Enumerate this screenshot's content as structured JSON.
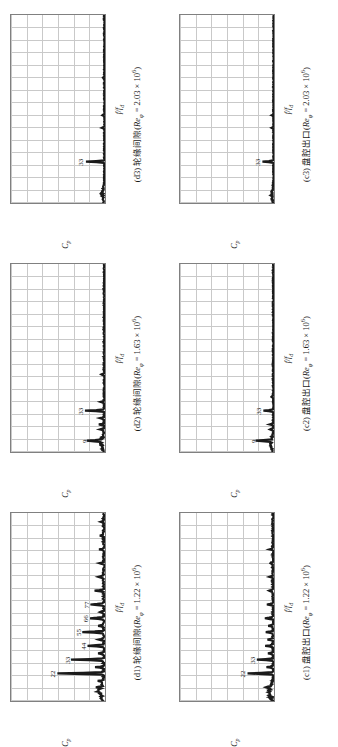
{
  "figure": {
    "orientation": "rotated-90-ccw",
    "columns": 3,
    "rows": 2,
    "axis": {
      "ylabel_main": "C",
      "ylabel_sub": "p",
      "xlabel_main": "f/f",
      "xlabel_sub": "d",
      "yticks": [
        "0",
        "0.1",
        "0.2",
        "0.3",
        "0.4",
        "0.5",
        "0.6"
      ],
      "xticks": [
        "0",
        "10",
        "20",
        "30",
        "40",
        "50",
        "60",
        "70",
        "80",
        "90",
        "100",
        "110",
        "120",
        "130",
        "140",
        "150"
      ]
    }
  },
  "chart_data": [
    {
      "id": "d1",
      "type": "line",
      "title": "(d1) 轮缘间隙(Re_φ = 1.22 × 10⁶)",
      "caption_prefix": "(d1) 轮缘间隙(",
      "caption_sym": "Re",
      "caption_sub": "φ",
      "caption_value": " = 1.22 × 10",
      "caption_sup": "6",
      "caption_suffix": ")",
      "xlabel": "f/f_d",
      "ylabel": "C_p",
      "xlim": [
        0,
        150
      ],
      "ylim": [
        0,
        0.6
      ],
      "grid": true,
      "peaks": [
        {
          "x": 22,
          "y": 0.3,
          "label": "22"
        },
        {
          "x": 33,
          "y": 0.205,
          "label": "33"
        },
        {
          "x": 44,
          "y": 0.105,
          "label": "44"
        },
        {
          "x": 55,
          "y": 0.135,
          "label": "55"
        },
        {
          "x": 66,
          "y": 0.09,
          "label": "66"
        },
        {
          "x": 77,
          "y": 0.082,
          "label": "77"
        }
      ],
      "minor_peaks": [
        {
          "x": 11,
          "y": 0.04
        },
        {
          "x": 16,
          "y": 0.03
        },
        {
          "x": 27,
          "y": 0.05
        },
        {
          "x": 38,
          "y": 0.035
        },
        {
          "x": 49,
          "y": 0.035
        },
        {
          "x": 60,
          "y": 0.03
        },
        {
          "x": 71,
          "y": 0.025
        },
        {
          "x": 88,
          "y": 0.055
        },
        {
          "x": 99,
          "y": 0.04
        },
        {
          "x": 110,
          "y": 0.03
        },
        {
          "x": 121,
          "y": 0.025
        },
        {
          "x": 132,
          "y": 0.022
        },
        {
          "x": 143,
          "y": 0.018
        }
      ],
      "noise_floor": 0.012
    },
    {
      "id": "d2",
      "type": "line",
      "title": "(d2) 轮缘间隙(Re_φ = 1.63 × 10⁶)",
      "caption_prefix": "(d2) 轮缘间隙(",
      "caption_sym": "Re",
      "caption_sub": "φ",
      "caption_value": " = 1.63 × 10",
      "caption_sup": "6",
      "caption_suffix": ")",
      "xlabel": "f/f_d",
      "ylabel": "C_p",
      "xlim": [
        0,
        150
      ],
      "ylim": [
        0,
        0.6
      ],
      "grid": true,
      "peaks": [
        {
          "x": 9,
          "y": 0.098,
          "label": "9"
        },
        {
          "x": 33,
          "y": 0.12,
          "label": "33"
        }
      ],
      "minor_peaks": [
        {
          "x": 18,
          "y": 0.03
        },
        {
          "x": 22,
          "y": 0.035
        },
        {
          "x": 27,
          "y": 0.028
        },
        {
          "x": 40,
          "y": 0.022
        },
        {
          "x": 62,
          "y": 0.016
        }
      ],
      "noise_floor": 0.008
    },
    {
      "id": "d3",
      "type": "line",
      "title": "(d3) 轮缘间隙(Re_φ = 2.03 × 10⁶)",
      "caption_prefix": "(d3) 轮缘间隙(",
      "caption_sym": "Re",
      "caption_sub": "φ",
      "caption_value": " = 2.03 × 10",
      "caption_sup": "6",
      "caption_suffix": ")",
      "xlabel": "f/f_d",
      "ylabel": "C_p",
      "xlim": [
        0,
        150
      ],
      "ylim": [
        0,
        0.6
      ],
      "grid": true,
      "peaks": [
        {
          "x": 33,
          "y": 0.12,
          "label": "33"
        }
      ],
      "minor_peaks": [
        {
          "x": 60,
          "y": 0.014
        },
        {
          "x": 70,
          "y": 0.012
        },
        {
          "x": 100,
          "y": 0.01
        }
      ],
      "noise_floor": 0.006
    },
    {
      "id": "c1",
      "type": "line",
      "title": "(c1) 盘腔出口(Re_φ = 1.22 × 10⁶)",
      "caption_prefix": "(c1) 盘腔出口(",
      "caption_sym": "Re",
      "caption_sub": "φ",
      "caption_value": " = 1.22 × 10",
      "caption_sup": "6",
      "caption_suffix": ")",
      "xlabel": "f/f_d",
      "ylabel": "C_p",
      "xlim": [
        0,
        150
      ],
      "ylim": [
        0,
        0.6
      ],
      "grid": true,
      "peaks": [
        {
          "x": 22,
          "y": 0.165,
          "label": "22"
        },
        {
          "x": 33,
          "y": 0.105,
          "label": "33"
        }
      ],
      "minor_peaks": [
        {
          "x": 11,
          "y": 0.035
        },
        {
          "x": 27,
          "y": 0.038
        },
        {
          "x": 38,
          "y": 0.03
        },
        {
          "x": 44,
          "y": 0.05
        },
        {
          "x": 49,
          "y": 0.032
        },
        {
          "x": 55,
          "y": 0.045
        },
        {
          "x": 60,
          "y": 0.03
        },
        {
          "x": 66,
          "y": 0.055
        },
        {
          "x": 77,
          "y": 0.035
        },
        {
          "x": 88,
          "y": 0.028
        },
        {
          "x": 99,
          "y": 0.024
        },
        {
          "x": 110,
          "y": 0.02
        },
        {
          "x": 121,
          "y": 0.018
        }
      ],
      "noise_floor": 0.01
    },
    {
      "id": "c2",
      "type": "line",
      "title": "(c2) 盘腔出口(Re_φ = 1.63 × 10⁶)",
      "caption_prefix": "(c2) 盘腔出口(",
      "caption_sym": "Re",
      "caption_sub": "φ",
      "caption_value": " = 1.63 × 10",
      "caption_sup": "6",
      "caption_suffix": ")",
      "xlabel": "f/f_d",
      "ylabel": "C_p",
      "xlim": [
        0,
        150
      ],
      "ylim": [
        0,
        0.6
      ],
      "grid": true,
      "peaks": [
        {
          "x": 9,
          "y": 0.095,
          "label": "9"
        },
        {
          "x": 33,
          "y": 0.065,
          "label": "33"
        }
      ],
      "minor_peaks": [
        {
          "x": 18,
          "y": 0.022
        },
        {
          "x": 22,
          "y": 0.025
        },
        {
          "x": 44,
          "y": 0.014
        }
      ],
      "noise_floor": 0.007
    },
    {
      "id": "c3",
      "type": "line",
      "title": "(c3) 盘腔出口(Re_φ = 2.03 × 10⁶)",
      "caption_prefix": "(c3) 盘腔出口(",
      "caption_sym": "Re",
      "caption_sub": "φ",
      "caption_value": " = 2.03 × 10",
      "caption_sup": "6",
      "caption_suffix": ")",
      "xlabel": "f/f_d",
      "ylabel": "C_p",
      "xlim": [
        0,
        150
      ],
      "ylim": [
        0,
        0.6
      ],
      "grid": true,
      "peaks": [
        {
          "x": 33,
          "y": 0.068,
          "label": "33"
        }
      ],
      "minor_peaks": [
        {
          "x": 60,
          "y": 0.012
        },
        {
          "x": 70,
          "y": 0.01
        }
      ],
      "noise_floor": 0.005
    }
  ]
}
